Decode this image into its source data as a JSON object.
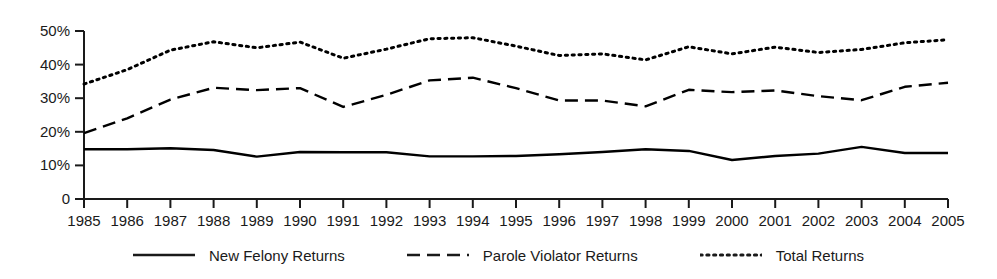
{
  "chart_data": {
    "type": "line",
    "title": "",
    "xlabel": "",
    "ylabel": "",
    "x": [
      1985,
      1986,
      1987,
      1988,
      1989,
      1990,
      1991,
      1992,
      1993,
      1994,
      1995,
      1996,
      1997,
      1998,
      1999,
      2000,
      2001,
      2002,
      2003,
      2004,
      2005
    ],
    "categories": [
      "1985",
      "1986",
      "1987",
      "1988",
      "1989",
      "1990",
      "1991",
      "1992",
      "1993",
      "1994",
      "1995",
      "1996",
      "1997",
      "1998",
      "1999",
      "2000",
      "2001",
      "2002",
      "2003",
      "2004",
      "2005"
    ],
    "ylim": [
      0,
      50
    ],
    "xlim": [
      1985,
      2005
    ],
    "ytick_values": [
      0,
      10,
      20,
      30,
      40,
      50
    ],
    "ytick_labels": [
      "0",
      "10%",
      "20%",
      "30%",
      "40%",
      "50%"
    ],
    "grid": false,
    "legend_position": "bottom",
    "series": [
      {
        "name": "New Felony Returns",
        "style": "solid",
        "color": "#000000",
        "values": [
          14.8,
          14.8,
          15.1,
          14.6,
          12.6,
          14.0,
          13.9,
          13.9,
          12.7,
          12.7,
          12.8,
          13.3,
          14.0,
          14.8,
          14.3,
          11.6,
          12.8,
          13.5,
          15.5,
          13.7,
          13.7
        ]
      },
      {
        "name": "Parole Violator Returns",
        "style": "dashed",
        "color": "#000000",
        "values": [
          19.6,
          24.0,
          29.6,
          33.1,
          32.4,
          33.0,
          27.4,
          31.0,
          35.3,
          36.1,
          33.0,
          29.3,
          29.3,
          27.6,
          32.5,
          31.8,
          32.3,
          30.6,
          29.4,
          33.4,
          34.6
        ]
      },
      {
        "name": "Total Returns",
        "style": "dotted",
        "color": "#000000",
        "values": [
          34.2,
          38.5,
          44.3,
          46.8,
          45.0,
          46.7,
          41.9,
          44.6,
          47.7,
          48.0,
          45.5,
          42.7,
          43.2,
          41.4,
          45.3,
          43.2,
          45.2,
          43.6,
          44.5,
          46.5,
          47.4
        ]
      }
    ]
  },
  "legend": {
    "items": [
      {
        "label": "New Felony Returns",
        "style": "solid"
      },
      {
        "label": "Parole Violator Returns",
        "style": "dashed"
      },
      {
        "label": "Total Returns",
        "style": "dotted"
      }
    ]
  }
}
